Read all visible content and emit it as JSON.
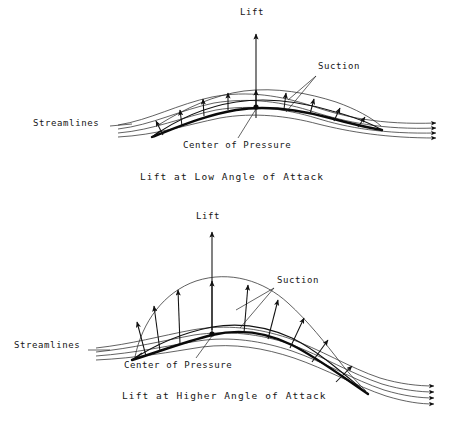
{
  "figure": {
    "title_top": "Lift at Low Angle of Attack",
    "title_bottom": "Lift at Higher Angle of Attack",
    "background_color": "#ffffff",
    "ink_color": "#111111"
  },
  "panels": [
    {
      "id": "low-angle",
      "caption": "Lift at Low Angle of Attack",
      "labels": {
        "lift": "Lift",
        "suction": "Suction",
        "streamlines": "Streamlines",
        "center_of_pressure": "Center of Pressure"
      }
    },
    {
      "id": "higher-angle",
      "caption": "Lift at Higher Angle of Attack",
      "labels": {
        "lift": "Lift",
        "suction": "Suction",
        "streamlines": "Streamlines",
        "center_of_pressure": "Center of Pressure"
      }
    }
  ],
  "icons": {
    "lift_arrow": "up-arrow-icon",
    "suction_arrow": "up-arrow-icon",
    "stream_arrow": "right-arrow-icon"
  }
}
